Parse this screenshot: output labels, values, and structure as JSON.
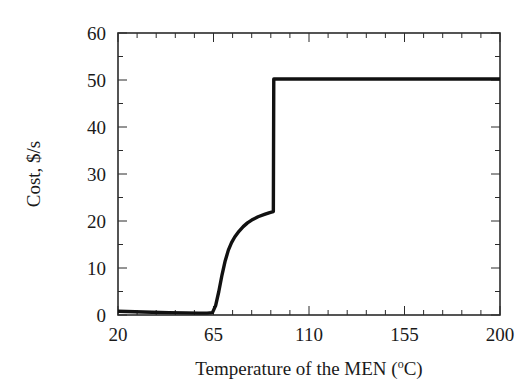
{
  "chart_data": {
    "type": "line",
    "title": "",
    "subtitle": "",
    "xlabel": "Temperature of the MEN  (°C)",
    "xlabel_main": "Temperature of the MEN  (",
    "xlabel_sup": "o",
    "xlabel_tail": "C)",
    "ylabel": "Cost, $/s",
    "xlim": [
      20,
      200
    ],
    "ylim": [
      0,
      60
    ],
    "x_ticks": [
      20,
      65,
      110,
      155,
      200
    ],
    "x_tick_labels": [
      "20",
      "65",
      "110",
      "155",
      "200"
    ],
    "y_ticks": [
      0,
      10,
      20,
      30,
      40,
      50,
      60
    ],
    "y_tick_labels": [
      "0",
      "10",
      "20",
      "30",
      "40",
      "50",
      "60"
    ],
    "x_minor_interval": 9,
    "y_minor_interval": 5,
    "grid": false,
    "legend": null,
    "ticks_direction": "in",
    "frame": "box",
    "line_color": "#111111",
    "series": [
      {
        "name": "Cost",
        "x": [
          20,
          28,
          36,
          44,
          52,
          58,
          62,
          64.5,
          66,
          67.5,
          69,
          70.5,
          72,
          73.5,
          75,
          77,
          79,
          81,
          83,
          86,
          89,
          91.5,
          93.2,
          93.4,
          96,
          110,
          130,
          155,
          180,
          200
        ],
        "y": [
          0.8,
          0.7,
          0.6,
          0.5,
          0.45,
          0.4,
          0.4,
          0.5,
          2.0,
          5.0,
          8.5,
          11.5,
          13.8,
          15.4,
          16.6,
          17.8,
          18.8,
          19.6,
          20.2,
          20.9,
          21.4,
          21.8,
          22.0,
          50.2,
          50.2,
          50.2,
          50.2,
          50.2,
          50.2,
          50.2
        ]
      }
    ],
    "annotations": [
      {
        "text": "step discontinuity",
        "x": 93.3,
        "y_from": 22.0,
        "y_to": 50.2
      }
    ]
  },
  "figure": {
    "background": "#ffffff",
    "axis_color": "#2b2b2b"
  }
}
